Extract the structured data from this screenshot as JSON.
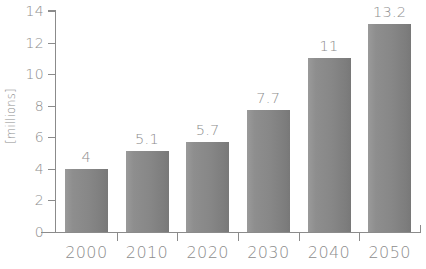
{
  "chart_data": {
    "type": "bar",
    "title": "",
    "subtitle": "",
    "xlabel": "",
    "ylabel": "[millions]",
    "categories": [
      "2000",
      "2010",
      "2020",
      "2030",
      "2040",
      "2050"
    ],
    "values": [
      4,
      5.1,
      5.7,
      7.7,
      11,
      13.2
    ],
    "value_labels": [
      "4",
      "5.1",
      "5.7",
      "7.7",
      "11",
      "13.2"
    ],
    "series": [
      {
        "name": "",
        "values": [
          4,
          5.1,
          5.7,
          7.7,
          11,
          13.2
        ]
      }
    ],
    "ylim": [
      0,
      14
    ],
    "yticks": [
      0,
      2,
      4,
      6,
      8,
      10,
      12,
      14
    ],
    "ytick_labels": [
      "0",
      "2",
      "4",
      "6",
      "8",
      "10",
      "12",
      "14"
    ],
    "grid": false,
    "legend": false,
    "legend_position": "none",
    "annotations": [],
    "bar_color": "#878787",
    "axis_color": "#8b8b8b",
    "text_color": "#8d8d8d",
    "background_color": "#ffffff"
  }
}
